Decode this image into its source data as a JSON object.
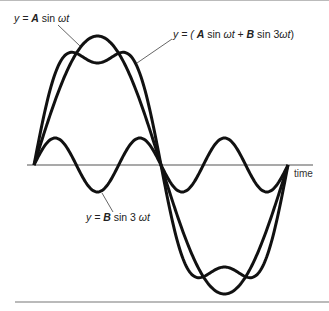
{
  "figure": {
    "labels": {
      "a_wave": {
        "prefix": "y = ",
        "coef": "A",
        "mid": " sin ",
        "arg": "ωt"
      },
      "sum_wave": {
        "prefix": "y = ( ",
        "coef1": "A",
        "mid1": " sin ",
        "arg1": "ωt",
        "plus": " + ",
        "coef2": "B",
        "mid2": " sin 3",
        "arg2": "ωt",
        "close": ")"
      },
      "b_wave": {
        "prefix": "y = ",
        "coef": "B",
        "mid": " sin 3 ",
        "arg": "ωt"
      },
      "time_axis": "time"
    },
    "params": {
      "x_start": 34,
      "x_end": 288,
      "baseline_y": 165,
      "amplitude_A": 129,
      "amplitude_B": 27,
      "harmonic": 3
    },
    "colors": {
      "curve": "#111111",
      "axis": "#555555",
      "rule": "#777777",
      "leader": "#555555"
    }
  }
}
